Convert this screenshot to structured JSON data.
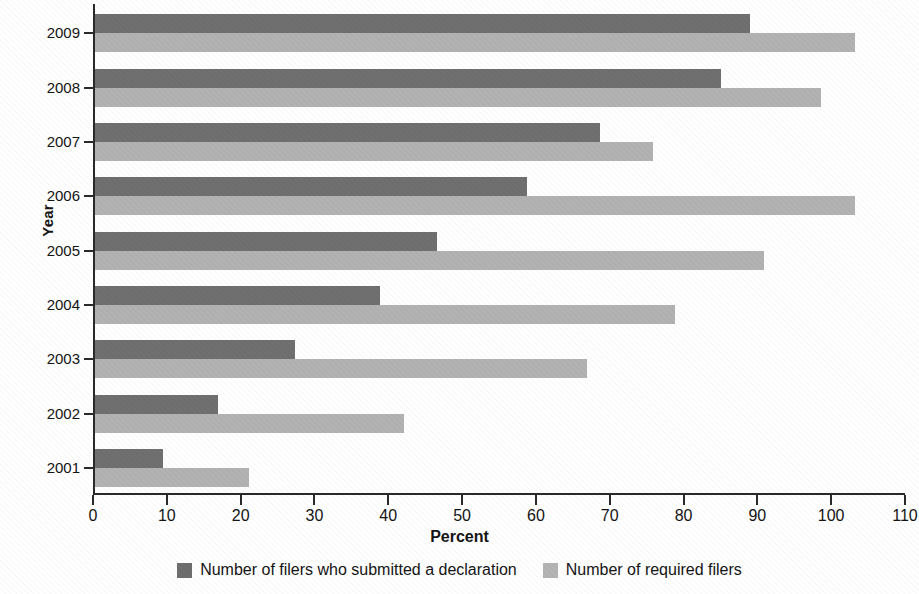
{
  "chart_data": {
    "type": "bar",
    "orientation": "horizontal",
    "title": "",
    "xlabel": "Percent",
    "ylabel": "Year",
    "categories": [
      "2009",
      "2008",
      "2007",
      "2006",
      "2005",
      "2004",
      "2003",
      "2002",
      "2001"
    ],
    "series": [
      {
        "name": "Number of filers who submitted a declaration",
        "color": "#6e6e6e",
        "values": [
          88.7,
          84.8,
          68.4,
          58.5,
          46.3,
          38.6,
          27.1,
          16.6,
          9.2
        ]
      },
      {
        "name": "Number of required filers",
        "color": "#b4b4b4",
        "values": [
          103.0,
          98.4,
          75.6,
          103.0,
          90.6,
          78.6,
          66.7,
          41.8,
          20.8
        ]
      }
    ],
    "xlim": [
      0,
      110
    ],
    "xticks": [
      0,
      10,
      20,
      30,
      40,
      50,
      60,
      70,
      80,
      90,
      100,
      110
    ],
    "xtick_labels": [
      "0",
      "10",
      "20",
      "30",
      "40",
      "50",
      "60",
      "70",
      "80",
      "90",
      "100",
      "110"
    ],
    "grid": false,
    "legend_position": "bottom"
  },
  "axes": {
    "y_title": "Year",
    "x_title": "Percent"
  },
  "legend": {
    "items": [
      {
        "label": "Number of filers who submitted a declaration",
        "color": "#6e6e6e"
      },
      {
        "label": "Number of required filers",
        "color": "#b4b4b4"
      }
    ]
  }
}
